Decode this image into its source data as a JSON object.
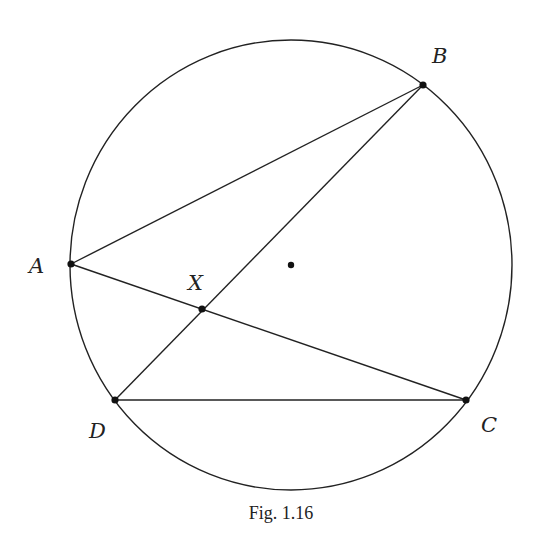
{
  "figure": {
    "caption": "Fig. 1.16",
    "circle": {
      "cx": 291,
      "cy": 265,
      "rx": 221,
      "ry": 225
    },
    "center_dot": {
      "x": 291,
      "y": 265
    },
    "points": {
      "A": {
        "label": "A",
        "x": 71,
        "y": 264,
        "lx": 29,
        "ly": 273
      },
      "B": {
        "label": "B",
        "x": 423,
        "y": 85,
        "lx": 432,
        "ly": 63
      },
      "C": {
        "label": "C",
        "x": 466,
        "y": 400,
        "lx": 481,
        "ly": 432
      },
      "D": {
        "label": "D",
        "x": 115,
        "y": 400,
        "lx": 89,
        "ly": 438
      },
      "X": {
        "label": "X",
        "x": 202,
        "y": 309,
        "lx": 188,
        "ly": 290
      }
    },
    "segments": [
      [
        "A",
        "B"
      ],
      [
        "A",
        "C"
      ],
      [
        "B",
        "D"
      ],
      [
        "D",
        "C"
      ]
    ]
  }
}
